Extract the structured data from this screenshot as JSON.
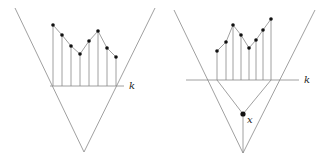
{
  "left": {
    "label_k": "k",
    "v": [
      [
        15,
        8
      ],
      [
        84,
        152
      ],
      [
        155,
        8
      ]
    ],
    "baseline": {
      "y": 86,
      "x1": 50,
      "x2": 124
    },
    "points": [
      [
        53,
        25
      ],
      [
        62,
        35
      ],
      [
        71,
        46
      ],
      [
        80,
        54
      ],
      [
        89,
        41
      ],
      [
        98,
        31
      ],
      [
        107,
        48
      ],
      [
        116,
        57
      ]
    ]
  },
  "right": {
    "label_k": "k",
    "label_x": "x",
    "v": [
      [
        174,
        10
      ],
      [
        243,
        153
      ],
      [
        315,
        10
      ]
    ],
    "baseline": {
      "y": 80,
      "x1": 186,
      "x2": 299
    },
    "points": [
      [
        217,
        51
      ],
      [
        226,
        42
      ],
      [
        233,
        25
      ],
      [
        241,
        35
      ],
      [
        249,
        48
      ],
      [
        256,
        40
      ],
      [
        263,
        30
      ],
      [
        271,
        19
      ]
    ],
    "apex": [
      243,
      114
    ]
  },
  "colors": {
    "line": "#888888",
    "dot": "#111111"
  }
}
